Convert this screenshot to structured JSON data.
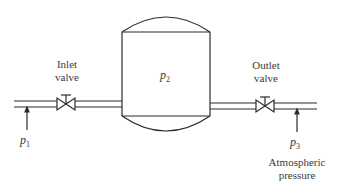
{
  "diagram": {
    "colors": {
      "line": "#2a2a2a",
      "text": "#3a3a3a",
      "background": "#ffffff"
    },
    "tank": {
      "label_var": "p",
      "label_sub": "2"
    },
    "inlet_valve": {
      "label_line1": "Inlet",
      "label_line2": "valve"
    },
    "outlet_valve": {
      "label_line1": "Outlet",
      "label_line2": "valve"
    },
    "inlet_pressure": {
      "label_var": "p",
      "label_sub": "1"
    },
    "outlet_pressure": {
      "label_var": "p",
      "label_sub": "3",
      "note_line1": "Atmospheric",
      "note_line2": "pressure"
    }
  }
}
